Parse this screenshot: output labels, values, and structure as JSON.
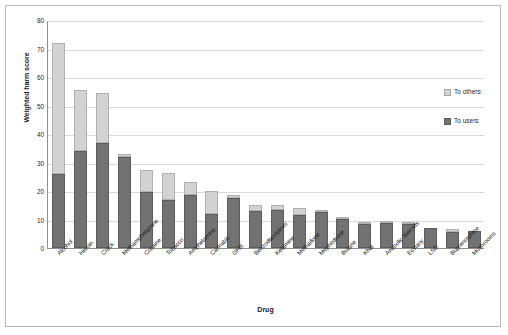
{
  "chart_data": {
    "type": "bar",
    "subtype": "stacked-vertical",
    "title": "",
    "xlabel": "Drug",
    "ylabel": "Weighted harm score",
    "ylim": [
      0,
      80
    ],
    "ytick_step": 10,
    "yticks": [
      "0",
      "10",
      "20",
      "30",
      "40",
      "50",
      "60",
      "70",
      "80"
    ],
    "grid": "horizontal",
    "legend_position": "inside-right",
    "categories": [
      "Alcohol",
      "Heroin",
      "Crack",
      "Methamphetamine",
      "Cocaine",
      "Tobacco",
      "Amphetamine",
      "Cannabis",
      "GHB",
      "Benzodiazepines",
      "Ketamine",
      "Methadone",
      "Mephedrone",
      "Butane",
      "Khat",
      "Anabolic Steroids",
      "Ecstasy",
      "LSD",
      "Buprenorphine",
      "Mushrooms"
    ],
    "series": [
      {
        "name": "To users",
        "color": "#727272",
        "values": [
          26,
          34,
          37,
          32,
          19.5,
          17,
          18.5,
          12,
          17.5,
          13,
          13.5,
          11.5,
          12.5,
          10.3,
          8.5,
          8.8,
          8.5,
          7,
          5.5,
          5.8
        ]
      },
      {
        "name": "To others",
        "color": "#d2d2d2",
        "values": [
          46,
          21.5,
          17.5,
          1,
          8,
          9.5,
          4.5,
          8,
          1,
          2,
          1.5,
          2.5,
          0.5,
          0.4,
          0.5,
          0.7,
          0.5,
          0,
          1.3,
          0
        ]
      }
    ],
    "totals": [
      72,
      55.5,
      54.5,
      33,
      27.5,
      26.5,
      23,
      20,
      18.5,
      15,
      15,
      14,
      13,
      10.7,
      9,
      9.5,
      9,
      7,
      6.8,
      5.8
    ]
  },
  "legend": {
    "entries": [
      {
        "label": "To others",
        "swatch": "others"
      },
      {
        "label": "To users",
        "swatch": "users"
      }
    ]
  },
  "axes": {
    "y_title": "Weighted harm score",
    "x_title": "Drug"
  }
}
